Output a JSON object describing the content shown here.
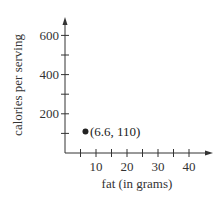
{
  "chart_data": {
    "type": "scatter",
    "title": "",
    "xlabel": "fat (in grams)",
    "ylabel": "calories per serving",
    "xlim": [
      0,
      45
    ],
    "ylim": [
      0,
      700
    ],
    "x_ticks": [
      5,
      10,
      15,
      20,
      25,
      30,
      35,
      40
    ],
    "x_tick_labels": [
      "10",
      "20",
      "30",
      "40"
    ],
    "x_tick_label_values": [
      10,
      20,
      30,
      40
    ],
    "y_ticks": [
      100,
      200,
      300,
      400,
      500,
      600
    ],
    "y_tick_labels": [
      "200",
      "400",
      "600"
    ],
    "y_tick_label_values": [
      200,
      400,
      600
    ],
    "grid": false,
    "legend": null,
    "series": [
      {
        "name": "data",
        "x": [
          6.6
        ],
        "y": [
          110
        ],
        "color": "#222222"
      }
    ],
    "annotations": [
      {
        "text": "(6.6, 110)",
        "x": 6.6,
        "y": 110
      }
    ]
  },
  "colors": {
    "axis": "#333333",
    "point": "#222222"
  }
}
